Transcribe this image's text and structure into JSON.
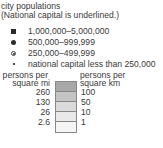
{
  "legend": {
    "title": "city populations",
    "subtitle": "(National capital is underlined.)",
    "population_classes": [
      {
        "symbol": "filled-square",
        "label": "1,000,000–5,000,000"
      },
      {
        "symbol": "filled-circle",
        "label": "500,000–999,999"
      },
      {
        "symbol": "ringed-circle",
        "label": "250,000–499,999"
      },
      {
        "symbol": "small-dot",
        "label": "national capital less than 250,000"
      }
    ],
    "density": {
      "left_header_1": "persons per",
      "left_header_2": "square mi",
      "right_header_1": "persons per",
      "right_header_2": "square km",
      "mi_breaks": [
        "260",
        "130",
        "26",
        "2.6"
      ],
      "km_breaks": [
        "100",
        "50",
        "10",
        "1"
      ],
      "colors": [
        "#a8a8a8",
        "#c4c4c4",
        "#dadada",
        "#e9e9e9",
        "#f5f5f5"
      ]
    }
  }
}
